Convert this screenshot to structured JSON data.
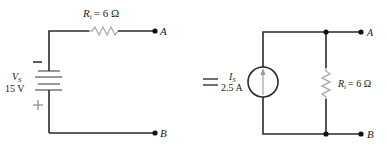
{
  "diagram": {
    "type": "circuit-equivalence",
    "equals_sign": "=",
    "left_circuit": {
      "name": "voltage-source-circuit",
      "source": {
        "symbol": "V",
        "subscript": "S",
        "value": "15 V",
        "minus_sign": "−",
        "plus_sign": "+"
      },
      "resistor": {
        "symbol": "R",
        "subscript": "i",
        "value": "= 6 Ω"
      },
      "terminals": {
        "top": "A",
        "bottom": "B"
      }
    },
    "right_circuit": {
      "name": "current-source-circuit",
      "source": {
        "symbol": "I",
        "subscript": "S",
        "value": "2.5 A"
      },
      "resistor": {
        "symbol": "R",
        "subscript": "i",
        "value": "= 6 Ω"
      },
      "terminals": {
        "top": "A",
        "bottom": "B"
      }
    },
    "colors": {
      "wire": "#2a2a2a",
      "resistor": "#b0b0b0",
      "text": "#222222"
    }
  }
}
